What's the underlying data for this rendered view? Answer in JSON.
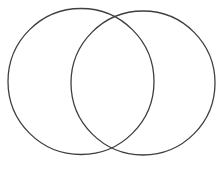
{
  "diagram": {
    "type": "venn",
    "background": "#ffffff",
    "stroke_color": "#3f3f3f",
    "stroke_width": 1.3,
    "circles": [
      {
        "id": "left",
        "cx": 81,
        "cy": 81.5,
        "r": 73
      },
      {
        "id": "right",
        "cx": 143,
        "cy": 83,
        "r": 72
      }
    ],
    "labels": []
  }
}
